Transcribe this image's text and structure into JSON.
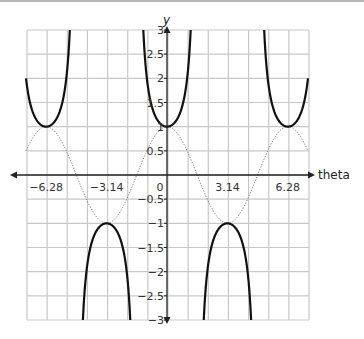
{
  "chart_data": {
    "type": "line",
    "title": "",
    "xlabel": "theta",
    "ylabel": "y",
    "xlim": [
      -7.3304,
      7.3304
    ],
    "ylim": [
      -3,
      3
    ],
    "grid": true,
    "grid_x_step": 1.0472,
    "grid_y_step": 0.5,
    "x_tick_labels": [
      {
        "value": -6.28,
        "label": "−6.28"
      },
      {
        "value": -3.14,
        "label": "−3.14"
      },
      {
        "value": 0,
        "label": "0"
      },
      {
        "value": 3.14,
        "label": "3.14"
      },
      {
        "value": 6.28,
        "label": "6.28"
      }
    ],
    "y_tick_labels": [
      {
        "value": 3,
        "label": "3"
      },
      {
        "value": 2.5,
        "label": "2.5"
      },
      {
        "value": 2,
        "label": "2"
      },
      {
        "value": 1.5,
        "label": "1.5"
      },
      {
        "value": 1,
        "label": "1"
      },
      {
        "value": 0.5,
        "label": "0.5"
      },
      {
        "value": -0.5,
        "label": "−0.5"
      },
      {
        "value": -1,
        "label": "−1"
      },
      {
        "value": -1.5,
        "label": "−1.5"
      },
      {
        "value": -2,
        "label": "−2"
      },
      {
        "value": -2.5,
        "label": "−2.5"
      },
      {
        "value": -3,
        "label": "−3"
      }
    ],
    "series": [
      {
        "name": "y = sec(theta)",
        "function": "sec",
        "style": "solid",
        "color": "#111111",
        "width": 2.2
      },
      {
        "name": "y = cos(theta)",
        "function": "cos",
        "style": "dotted",
        "color": "#777777",
        "width": 1
      }
    ],
    "sample_points": {
      "cos": {
        "x": [
          -6.28,
          -4.71,
          -3.14,
          -1.57,
          0,
          1.57,
          3.14,
          4.71,
          6.28
        ],
        "y": [
          1,
          0,
          -1,
          0,
          1,
          0,
          -1,
          0,
          1
        ]
      },
      "sec": {
        "x": [
          -6.28,
          -3.14,
          0,
          3.14,
          6.28
        ],
        "y": [
          1,
          -1,
          1,
          -1,
          1
        ]
      }
    }
  },
  "colors": {
    "grid": "#c8c8c8",
    "axis": "#222222",
    "sec_curve": "#111111",
    "cos_curve": "#777777"
  }
}
